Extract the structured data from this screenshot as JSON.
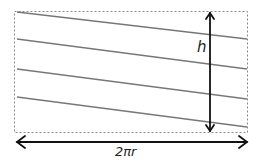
{
  "diagram": {
    "labels": {
      "height": "h",
      "circumference": "2πr"
    },
    "colors": {
      "border": "#888888",
      "lines": "#777777",
      "arrows": "#111111"
    },
    "helix_lines_count": 4
  }
}
